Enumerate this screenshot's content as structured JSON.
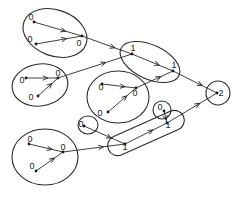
{
  "diagram": {
    "type": "hierarchical-merge-tree",
    "colors": {
      "stroke": "#2a2a2a",
      "background": "#ffffff"
    },
    "nodes": [
      {
        "id": "a0",
        "label": "0",
        "x": 34,
        "y": 22,
        "lx": 31,
        "ly": 20
      },
      {
        "id": "a1",
        "label": "0",
        "x": 36,
        "y": 44,
        "lx": 30,
        "ly": 42
      },
      {
        "id": "a2",
        "label": "0",
        "x": 82,
        "y": 36,
        "lx": 79,
        "ly": 46
      },
      {
        "id": "b0",
        "label": "0",
        "x": 26,
        "y": 78,
        "lx": 22,
        "ly": 83
      },
      {
        "id": "b1",
        "label": "0",
        "x": 58,
        "y": 78,
        "lx": 58,
        "ly": 76
      },
      {
        "id": "b2",
        "label": "0",
        "x": 38,
        "y": 96,
        "lx": 31,
        "ly": 100
      },
      {
        "id": "c0",
        "label": "0",
        "x": 102,
        "y": 84,
        "lx": 101,
        "ly": 90
      },
      {
        "id": "c1",
        "label": "0",
        "x": 108,
        "y": 112,
        "lx": 100,
        "ly": 116
      },
      {
        "id": "c2",
        "label": "0",
        "x": 136,
        "y": 88,
        "lx": 135,
        "ly": 96
      },
      {
        "id": "l1a",
        "label": "1",
        "x": 132,
        "y": 54,
        "lx": 133,
        "ly": 51
      },
      {
        "id": "l1b",
        "label": "1",
        "x": 173,
        "y": 71,
        "lx": 174,
        "ly": 68
      },
      {
        "id": "d0",
        "label": "0",
        "x": 84,
        "y": 126,
        "lx": 81,
        "ly": 127
      },
      {
        "id": "e0",
        "label": "0",
        "x": 164,
        "y": 111,
        "lx": 160,
        "ly": 110
      },
      {
        "id": "l1c",
        "label": "1",
        "x": 167,
        "y": 123,
        "lx": 168,
        "ly": 128
      },
      {
        "id": "l1d",
        "label": "1",
        "x": 125,
        "y": 144,
        "lx": 125,
        "ly": 150
      },
      {
        "id": "f0",
        "label": "0",
        "x": 29,
        "y": 144,
        "lx": 30,
        "ly": 142
      },
      {
        "id": "f1",
        "label": "0",
        "x": 63,
        "y": 152,
        "lx": 63,
        "ly": 150
      },
      {
        "id": "f2",
        "label": "0",
        "x": 36,
        "y": 171,
        "lx": 32,
        "ly": 169
      },
      {
        "id": "root",
        "label": "2",
        "x": 217,
        "y": 93,
        "lx": 221,
        "ly": 96
      }
    ],
    "clusters": [
      {
        "id": "ellipse-top-left",
        "cx": 55,
        "cy": 33,
        "rx": 33,
        "ry": 23,
        "rot": 20
      },
      {
        "id": "ellipse-mid-left",
        "cx": 40,
        "cy": 85,
        "rx": 28,
        "ry": 21,
        "rot": -8
      },
      {
        "id": "ellipse-center",
        "cx": 118,
        "cy": 97,
        "rx": 31,
        "ry": 26,
        "rot": 0
      },
      {
        "id": "ellipse-level1-top",
        "cx": 150,
        "cy": 62,
        "rx": 32,
        "ry": 17,
        "rot": 25
      },
      {
        "id": "circle-root",
        "cx": 218,
        "cy": 93,
        "rx": 12,
        "ry": 12,
        "rot": 0
      },
      {
        "id": "circle-lone-0",
        "cx": 88,
        "cy": 125,
        "rx": 10,
        "ry": 9,
        "rot": 0
      },
      {
        "id": "circle-lone-0b",
        "cx": 162,
        "cy": 110,
        "rx": 9,
        "ry": 9,
        "rot": 0
      },
      {
        "id": "capsule-level1-bottom",
        "cx": 146,
        "cy": 133,
        "rx": 41,
        "ry": 10,
        "rot": -24
      },
      {
        "id": "ellipse-bottom-left",
        "cx": 45,
        "cy": 157,
        "rx": 33,
        "ry": 28,
        "rot": 0
      }
    ],
    "edges": [
      {
        "from": "a0",
        "to": "a2"
      },
      {
        "from": "a1",
        "to": "a2"
      },
      {
        "from": "a2",
        "to": "l1a"
      },
      {
        "from": "b0",
        "to": "b1"
      },
      {
        "from": "b2",
        "to": "b1"
      },
      {
        "from": "b1",
        "to": "l1a"
      },
      {
        "from": "c0",
        "to": "c2"
      },
      {
        "from": "c1",
        "to": "c2"
      },
      {
        "from": "c2",
        "to": "l1b"
      },
      {
        "from": "l1a",
        "to": "l1b"
      },
      {
        "from": "l1b",
        "to": "root"
      },
      {
        "from": "d0",
        "to": "l1d"
      },
      {
        "from": "e0",
        "to": "l1c"
      },
      {
        "from": "f0",
        "to": "f1"
      },
      {
        "from": "f2",
        "to": "f1"
      },
      {
        "from": "f1",
        "to": "l1d"
      },
      {
        "from": "l1d",
        "to": "l1c"
      },
      {
        "from": "l1c",
        "to": "root"
      }
    ]
  }
}
